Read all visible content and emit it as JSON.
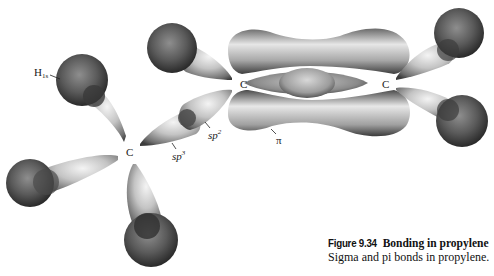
{
  "figure": {
    "number": "Figure 9.34",
    "title": "Bonding in propylene",
    "caption": "Sigma and pi bonds in propylene."
  },
  "labels": {
    "h_orbital": {
      "main": "H",
      "sub": "1s"
    },
    "carbon_sp3": "C",
    "carbon_left": "C",
    "carbon_right": "C",
    "sp3": {
      "main": "sp",
      "sup": "3"
    },
    "sp2": {
      "main": "sp",
      "sup": "2"
    },
    "pi": "π"
  },
  "colors": {
    "background": "#ffffff",
    "orbital_light": "#f2f2f2",
    "orbital_mid": "#9a9a9a",
    "orbital_dark": "#3a3a3a",
    "sphere_light": "#8c8c8c",
    "sphere_dark": "#2e2e2e",
    "text": "#1a1a1a"
  }
}
